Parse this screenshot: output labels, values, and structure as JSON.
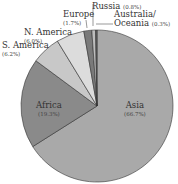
{
  "chart_data": {
    "type": "pie",
    "title": "",
    "slices": [
      {
        "label": "Asia",
        "value": 66.7,
        "display": "(66.7%)",
        "color": "#a9a9a9"
      },
      {
        "label": "Africa",
        "value": 19.3,
        "display": "(19.3%)",
        "color": "#8a8a8a"
      },
      {
        "label": "S. America",
        "value": 6.2,
        "display": "(6.2%)",
        "color": "#c8c8c8"
      },
      {
        "label": "N. America",
        "value": 6.0,
        "display": "(6.0%)",
        "color": "#dcdcdc"
      },
      {
        "label": "Europe",
        "value": 1.7,
        "display": "(1.7%)",
        "color": "#7a7a7a"
      },
      {
        "label": "Russia",
        "value": 0.8,
        "display": "(0.8%)",
        "color": "#bdbdbd"
      },
      {
        "label": "Australia/ Oceania",
        "value": 0.3,
        "display": "(0.3%)",
        "color": "#666666"
      }
    ],
    "legend": "none (direct labels)"
  },
  "labels": {
    "asia": {
      "name": "Asia",
      "pct": "(66.7%)"
    },
    "africa": {
      "name": "Africa",
      "pct": "(19.3%)"
    },
    "s_america": {
      "name": "S. America",
      "pct": "(6.2%)"
    },
    "n_america": {
      "name": "N. America",
      "pct": "(6.0%)"
    },
    "europe": {
      "name": "Europe",
      "pct": "(1.7%)"
    },
    "russia": {
      "name": "Russia",
      "pct": "(0.8%)"
    },
    "australia": {
      "name1": "Australia/",
      "name2": "Oceania",
      "pct": "(0.3%)"
    }
  }
}
